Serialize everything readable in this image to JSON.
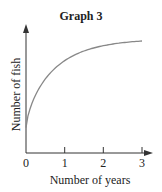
{
  "chart_data": {
    "type": "line",
    "title": "Graph 3",
    "xlabel": "Number of years",
    "ylabel": "Number of fish",
    "x_ticks": [
      "0",
      "1",
      "2",
      "3"
    ],
    "xlim": [
      0,
      3
    ],
    "y_ticks": [],
    "grid": false,
    "legend": null,
    "series": [
      {
        "name": "fish",
        "x": [
          0,
          0.25,
          0.5,
          1,
          1.5,
          2,
          2.5,
          3
        ],
        "y": [
          0.2,
          0.42,
          0.52,
          0.65,
          0.74,
          0.81,
          0.87,
          0.9
        ]
      }
    ],
    "line_color": "#888888"
  }
}
